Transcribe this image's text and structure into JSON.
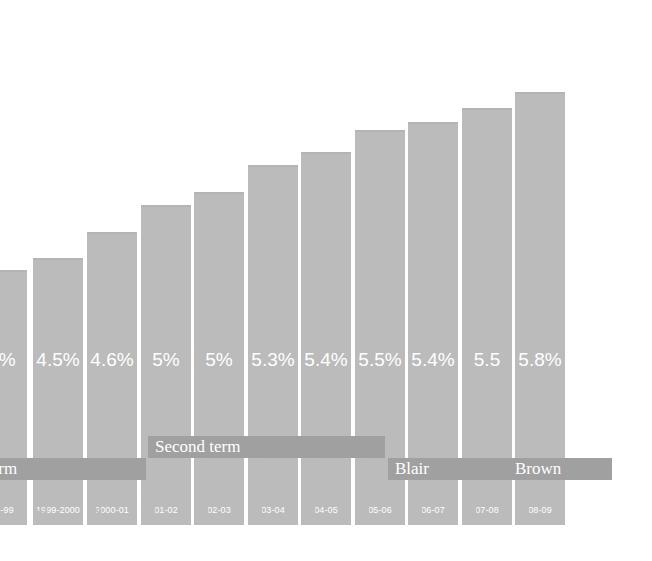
{
  "chart_data": {
    "type": "bar",
    "title": "",
    "xlabel": "",
    "ylabel": "",
    "categories": [
      "98-99",
      "1999-2000",
      "2000-01",
      "01-02",
      "02-03",
      "03-04",
      "04-05",
      "05-06",
      "06-07",
      "07-08",
      "08-09"
    ],
    "values": [
      49.7,
      51.3,
      55.2,
      60.2,
      62.3,
      67.6,
      70.2,
      73.6,
      75.0,
      78.1,
      80.8
    ],
    "value_labels": [
      "£49.7bn",
      "£51.3bn",
      "£55.2bn",
      "£60.2bn",
      "£62.3bn",
      "£67.6bn",
      "£70.2bn",
      "£73.6bn",
      "£75bn",
      "£78.1bn",
      "£80.8bn"
    ],
    "percent_labels": [
      "5%",
      "4.5%",
      "4.6%",
      "5%",
      "5%",
      "5.3%",
      "5.4%",
      "5.5%",
      "5.4%",
      "5.5",
      "5.8%"
    ],
    "percent_values": [
      5.0,
      4.5,
      4.6,
      5.0,
      5.0,
      5.3,
      5.4,
      5.5,
      5.4,
      5.5,
      5.8
    ],
    "grid": false,
    "legend": "none",
    "ylim": [
      0,
      92
    ],
    "bar_color": "#bbbbbb",
    "band_color": "#a0a0a0",
    "label_color": "#bcbcbc",
    "inbar_text_color": "#ffffff",
    "background": "#ffffff"
  },
  "bars": [
    {
      "year": "98-99",
      "value_label": "£49.7bn",
      "percent": "5%",
      "height": 255,
      "x": -23,
      "clipped": true
    },
    {
      "year": "1999-2000",
      "value_label": "£51.3bn",
      "percent": "4.5%",
      "height": 267,
      "x": 33
    },
    {
      "year": "2000-01",
      "value_label": "£55.2bn",
      "percent": "4.6%",
      "height": 293,
      "x": 87
    },
    {
      "year": "01-02",
      "value_label": "£60.2bn",
      "percent": "5%",
      "height": 320,
      "x": 141
    },
    {
      "year": "02-03",
      "value_label": "£62.3bn",
      "percent": "5%",
      "height": 333,
      "x": 194
    },
    {
      "year": "03-04",
      "value_label": "£67.6bn",
      "percent": "5.3%",
      "height": 360,
      "x": 248
    },
    {
      "year": "04-05",
      "value_label": "£70.2bn",
      "percent": "5.4%",
      "height": 373,
      "x": 301
    },
    {
      "year": "05-06",
      "value_label": "£73.6bn",
      "percent": "5.5%",
      "height": 395,
      "x": 355
    },
    {
      "year": "06-07",
      "value_label": "£75bn",
      "percent": "5.4%",
      "height": 403,
      "x": 408
    },
    {
      "year": "07-08",
      "value_label": "£78.1bn",
      "percent": "5.5",
      "height": 417,
      "x": 462
    },
    {
      "year": "08-09",
      "value_label": "£80.8bn",
      "percent": "5.8%",
      "height": 433,
      "x": 515
    }
  ],
  "bands": [
    {
      "label": "First term",
      "display": "t term",
      "x": -30,
      "width": 176,
      "y": 458
    },
    {
      "label": "Second term",
      "display": "Second term",
      "x": 148,
      "width": 237,
      "y": 436
    },
    {
      "label": "Blair",
      "display": "Blair",
      "x": 388,
      "width": 120,
      "y": 458
    },
    {
      "label": "Brown",
      "display": "Brown",
      "x": 508,
      "width": 104,
      "y": 458
    }
  ]
}
